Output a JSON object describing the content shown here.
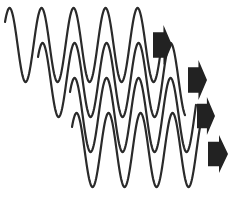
{
  "diagram": {
    "colors": {
      "wave": "#2a2a2a",
      "arrow": "#222222",
      "background": "#ffffff"
    },
    "waves": [
      {
        "id": "wave-1",
        "x0": 5,
        "x1": 160,
        "midY": 45,
        "amp": 37,
        "period": 32,
        "startPhase": -0.9
      },
      {
        "id": "wave-2",
        "x0": 38,
        "x1": 185,
        "midY": 80,
        "amp": 37,
        "period": 32,
        "startPhase": -0.9
      },
      {
        "id": "wave-3",
        "x0": 70,
        "x1": 196,
        "midY": 115,
        "amp": 37,
        "period": 32,
        "startPhase": -0.9
      },
      {
        "id": "wave-4",
        "x0": 72,
        "x1": 200,
        "midY": 150,
        "amp": 37,
        "period": 32,
        "startPhase": -0.9
      }
    ],
    "arrows": [
      {
        "id": "arrow-1",
        "x": 153,
        "y": 25,
        "w": 19,
        "h": 40
      },
      {
        "id": "arrow-2",
        "x": 188,
        "y": 60,
        "w": 19,
        "h": 40
      },
      {
        "id": "arrow-3",
        "x": 197,
        "y": 97,
        "w": 18,
        "h": 38
      },
      {
        "id": "arrow-4",
        "x": 208,
        "y": 135,
        "w": 20,
        "h": 38
      }
    ]
  }
}
